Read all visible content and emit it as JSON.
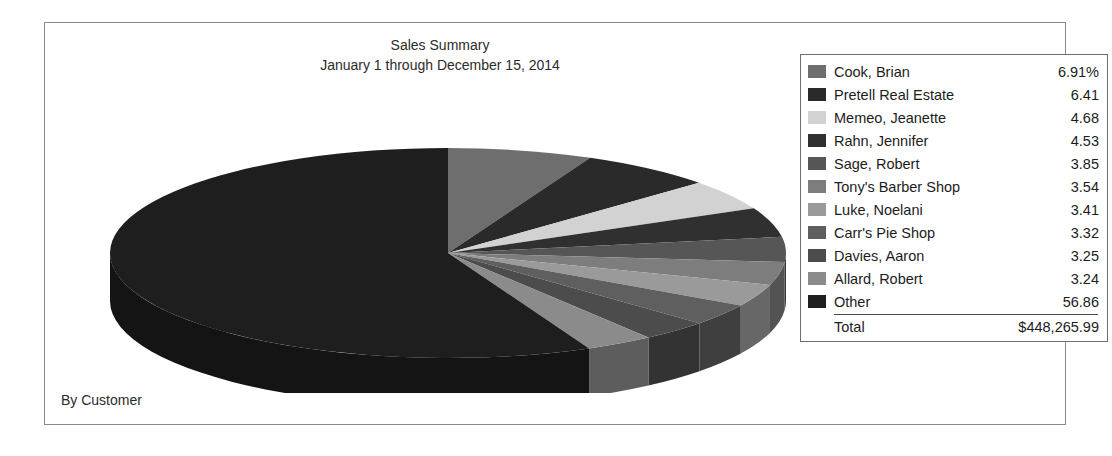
{
  "report": {
    "title_line1": "Sales Summary",
    "title_line2": "January 1 through December 15, 2014",
    "footer_label": "By Customer"
  },
  "legend": {
    "total_label": "Total",
    "total_value": "$448,265.99"
  },
  "chart_data": {
    "type": "pie",
    "title": "Sales Summary",
    "subtitle": "January 1 through December 15, 2014",
    "xlabel": "",
    "ylabel": "",
    "grid": false,
    "legend_position": "right",
    "value_unit": "percent",
    "total": "$448,265.99",
    "total_numeric": 448265.99,
    "first_value_suffix": "%",
    "categories": [
      "Cook, Brian",
      "Pretell Real Estate",
      "Memeo, Jeanette",
      "Rahn, Jennifer",
      "Sage, Robert",
      "Tony's Barber Shop",
      "Luke, Noelani",
      "Carr's Pie Shop",
      "Davies, Aaron",
      "Allard, Robert",
      "Other"
    ],
    "values": [
      6.91,
      6.41,
      4.68,
      4.53,
      3.85,
      3.54,
      3.41,
      3.32,
      3.25,
      3.24,
      56.86
    ],
    "value_labels": [
      "6.91%",
      "6.41",
      "4.68",
      "4.53",
      "3.85",
      "3.54",
      "3.41",
      "3.32",
      "3.25",
      "3.24",
      "56.86"
    ],
    "colors": [
      "#6e6e6e",
      "#2a2a2a",
      "#d2d2d2",
      "#303030",
      "#565656",
      "#7d7d7d",
      "#9a9a9a",
      "#5f5f5f",
      "#4c4c4c",
      "#8b8b8b",
      "#1e1e1e"
    ],
    "side_colors": [
      "#4a4a4a",
      "#1a1a1a",
      "#8f8f8f",
      "#1f1f1f",
      "#383838",
      "#535353",
      "#676767",
      "#3f3f3f",
      "#333333",
      "#5d5d5d",
      "#141414"
    ]
  }
}
